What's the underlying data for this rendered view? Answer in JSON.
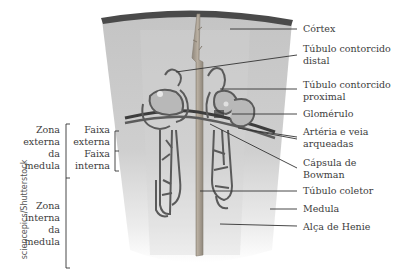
{
  "diagram": {
    "right_labels": [
      {
        "id": "cortex",
        "text": "Córtex"
      },
      {
        "id": "distal",
        "line1": "Túbulo contorcido",
        "line2": "distal"
      },
      {
        "id": "proximal",
        "line1": "Túbulo contorcido",
        "line2": "proximal"
      },
      {
        "id": "glomerulo",
        "text": "Glomérulo"
      },
      {
        "id": "arterias",
        "line1": "Artéria e veia",
        "line2": "arqueadas"
      },
      {
        "id": "capsula",
        "line1": "Cápsula de",
        "line2": "Bowman"
      },
      {
        "id": "coletor",
        "text": "Túbulo coletor"
      },
      {
        "id": "medula",
        "text": "Medula"
      },
      {
        "id": "alca",
        "text": "Alça de Henie"
      }
    ],
    "left_labels": {
      "zona_externa": [
        "Zona",
        "externa",
        "da",
        "medula"
      ],
      "faixa_externa": [
        "Faixa",
        "externa"
      ],
      "faixa_interna": [
        "Faixa",
        "interna"
      ],
      "zona_interna": [
        "Zona",
        "interna",
        "da",
        "medula"
      ]
    },
    "credit": "sciencepics/Shutterstock",
    "colors": {
      "cortex_band": "#4a4a4a",
      "tissue": "#c9c9c9",
      "tubule": "#5a5a5a",
      "collecting_duct": "#a89f93",
      "leader_line": "#333333"
    }
  }
}
